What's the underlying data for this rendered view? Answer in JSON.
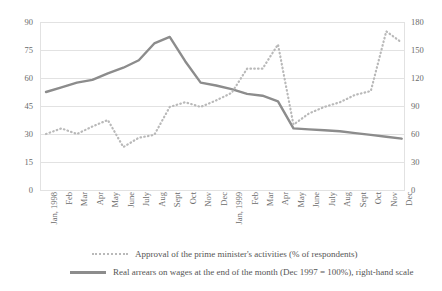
{
  "chart_data": {
    "type": "line",
    "title": "",
    "xlabel": "",
    "grid": true,
    "legend_position": "bottom",
    "categories": [
      "Jan, 1998",
      "Feb",
      "Mar",
      "Apr",
      "May",
      "June",
      "July",
      "Aug",
      "Sept",
      "Oct",
      "Nov",
      "Dec",
      "Jan, 1999",
      "Feb",
      "Mar",
      "Apr",
      "May",
      "June",
      "July",
      "Aug",
      "Sept",
      "Oct",
      "Nov",
      "Dec"
    ],
    "axes": {
      "left": {
        "label": "Approval of the prime minister's activities (% of respondents)",
        "ticks": [
          90,
          75,
          60,
          45,
          30,
          15,
          0
        ],
        "ylim": [
          0,
          90
        ]
      },
      "right": {
        "label": "Real arrears on wages at the end of the month (Dec 1997 = 100%)",
        "ticks": [
          180,
          150,
          120,
          90,
          60,
          30,
          0
        ],
        "ylim": [
          0,
          180
        ]
      }
    },
    "series": [
      {
        "name": "Approval of the prime minister's activities (% of respondents)",
        "axis": "left",
        "style": "dotted",
        "color": "#b9b9b9",
        "values": [
          30,
          33,
          30,
          34,
          37.5,
          23,
          28,
          29.5,
          44.5,
          47,
          44.5,
          48,
          52,
          65,
          65,
          78,
          35,
          41,
          44.5,
          47,
          51,
          53,
          85,
          79
        ]
      },
      {
        "name": "Real arrears on wages at the end of the month (Dec 1997 = 100%), right-hand scale",
        "axis": "right",
        "style": "solid",
        "color": "#8c8c8c",
        "values": [
          105,
          110,
          115,
          118,
          125,
          131,
          139,
          157,
          164,
          138,
          115,
          112,
          108,
          103,
          101,
          95,
          66,
          65,
          64,
          63,
          61,
          59,
          57,
          55
        ]
      }
    ]
  },
  "legend": {
    "items": [
      {
        "label": "Approval of the prime minister's activities (% of respondents)",
        "marker": "dotted-line-marker"
      },
      {
        "label": "Real arrears on wages at the end of the month (Dec 1997 = 100%), right-hand scale",
        "marker": "solid-line-marker"
      }
    ]
  },
  "colors": {
    "series_solid": "#8c8c8c",
    "series_dotted": "#b9b9b9",
    "gridline": "#e2e2e2",
    "text": "#5a5a5a",
    "background": "#ffffff"
  }
}
